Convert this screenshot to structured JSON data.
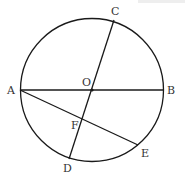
{
  "figure": {
    "type": "circle-geometry",
    "stroke_color": "#1a1a1a",
    "label_color": "#333333",
    "circle": {
      "center": "O",
      "cx": 92,
      "cy": 90,
      "r": 71.5
    },
    "points": {
      "A": {
        "label": "A",
        "x": 20,
        "y": 90,
        "lx": 7,
        "ly": 94
      },
      "B": {
        "label": "B",
        "x": 163,
        "y": 90,
        "lx": 167,
        "ly": 94
      },
      "C": {
        "label": "C",
        "x": 114,
        "y": 20,
        "lx": 111,
        "ly": 15
      },
      "D": {
        "label": "D",
        "x": 69,
        "y": 159,
        "lx": 63,
        "ly": 172
      },
      "E": {
        "label": "E",
        "x": 138,
        "y": 145,
        "lx": 141,
        "ly": 157
      },
      "O": {
        "label": "O",
        "x": 92,
        "y": 90,
        "lx": 82,
        "ly": 86
      },
      "F": {
        "label": "F",
        "x": 82,
        "y": 119,
        "lx": 71,
        "ly": 129
      }
    },
    "segments": [
      {
        "name": "AB",
        "from": "A",
        "to": "B"
      },
      {
        "name": "CD",
        "from": "C",
        "to": "D"
      },
      {
        "name": "AE",
        "from": "A",
        "to": "E"
      }
    ]
  }
}
